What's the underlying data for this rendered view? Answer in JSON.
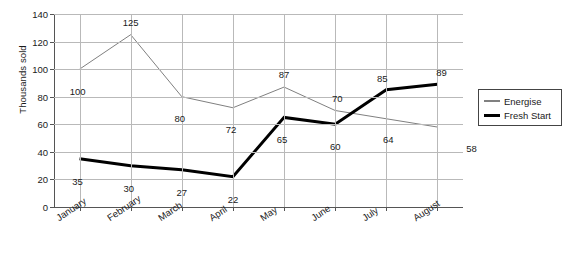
{
  "chart_data": {
    "type": "line",
    "title": "",
    "xlabel": "",
    "ylabel": "Thousands sold",
    "categories": [
      "January",
      "February",
      "March",
      "April",
      "May",
      "June",
      "July",
      "August"
    ],
    "ylim": [
      0,
      140
    ],
    "ytick_step": 20,
    "yticks": [
      "0",
      "20",
      "40",
      "60",
      "80",
      "100",
      "120",
      "140"
    ],
    "grid": "horizontal-and-vertical",
    "legend_position": "right",
    "series": [
      {
        "name": "Energise",
        "color": "#808080",
        "line_width": 1,
        "values": [
          100,
          125,
          80,
          72,
          87,
          70,
          64,
          58
        ],
        "labels": [
          "100",
          "125",
          "80",
          "72",
          "87",
          "70",
          "64",
          "58"
        ]
      },
      {
        "name": "Fresh Start",
        "color": "#000000",
        "line_width": 3,
        "values": [
          35,
          30,
          27,
          22,
          65,
          60,
          85,
          89
        ],
        "labels": [
          "35",
          "30",
          "27",
          "22",
          "65",
          "60",
          "85",
          "89"
        ]
      }
    ]
  },
  "legend": {
    "items": [
      {
        "label": "Energise",
        "color": "#808080",
        "thickness": "2px"
      },
      {
        "label": "Fresh Start",
        "color": "#000000",
        "thickness": "3px"
      }
    ]
  },
  "axis": {
    "y_title": "Thousands sold"
  },
  "colors": {
    "background": "#ffffff",
    "grid": "#b9b9b9",
    "axis": "#555555",
    "text": "#1a1a1a",
    "energise": "#808080",
    "fresh_start": "#000000"
  }
}
